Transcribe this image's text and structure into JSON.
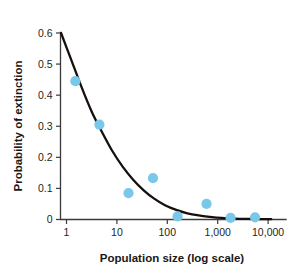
{
  "chart_data": {
    "type": "scatter",
    "title": "",
    "xlabel": "Population size (log scale)",
    "ylabel": "Probability of extinction",
    "x_scale": "log",
    "xlim": [
      0.72,
      14000
    ],
    "ylim": [
      0,
      0.6
    ],
    "grid": false,
    "legend": null,
    "x_ticks": [
      {
        "value": 1,
        "label": "1"
      },
      {
        "value": 10,
        "label": "10"
      },
      {
        "value": 100,
        "label": "100"
      },
      {
        "value": 1000,
        "label": "1,000"
      },
      {
        "value": 10000,
        "label": "10,000"
      }
    ],
    "y_ticks": [
      {
        "value": 0,
        "label": "0"
      },
      {
        "value": 0.1,
        "label": "0.1"
      },
      {
        "value": 0.2,
        "label": "0.2"
      },
      {
        "value": 0.3,
        "label": "0.3"
      },
      {
        "value": 0.4,
        "label": "0.4"
      },
      {
        "value": 0.5,
        "label": "0.5"
      },
      {
        "value": 0.6,
        "label": "0.6"
      }
    ],
    "series": [
      {
        "name": "Observed populations",
        "type": "scatter",
        "marker": "circle",
        "color": "#79c8ea",
        "points": [
          {
            "x": 1.5,
            "y": 0.445
          },
          {
            "x": 4.5,
            "y": 0.305
          },
          {
            "x": 17,
            "y": 0.085
          },
          {
            "x": 52,
            "y": 0.133
          },
          {
            "x": 160,
            "y": 0.01
          },
          {
            "x": 600,
            "y": 0.05
          },
          {
            "x": 1800,
            "y": 0.005
          },
          {
            "x": 5500,
            "y": 0.007
          }
        ]
      },
      {
        "name": "Fitted decay curve",
        "type": "line",
        "color": "#15100d",
        "points": [
          {
            "x": 0.78,
            "y": 0.6
          },
          {
            "x": 1.2,
            "y": 0.52
          },
          {
            "x": 2.0,
            "y": 0.425
          },
          {
            "x": 3.2,
            "y": 0.345
          },
          {
            "x": 5.0,
            "y": 0.283
          },
          {
            "x": 8.0,
            "y": 0.222
          },
          {
            "x": 13,
            "y": 0.17
          },
          {
            "x": 21,
            "y": 0.128
          },
          {
            "x": 34,
            "y": 0.094
          },
          {
            "x": 55,
            "y": 0.067
          },
          {
            "x": 90,
            "y": 0.046
          },
          {
            "x": 150,
            "y": 0.031
          },
          {
            "x": 250,
            "y": 0.02
          },
          {
            "x": 420,
            "y": 0.013
          },
          {
            "x": 700,
            "y": 0.0085
          },
          {
            "x": 1200,
            "y": 0.005
          },
          {
            "x": 2200,
            "y": 0.003
          },
          {
            "x": 4000,
            "y": 0.002
          },
          {
            "x": 7000,
            "y": 0.0015
          },
          {
            "x": 11500,
            "y": 0.001
          }
        ]
      }
    ],
    "colors": {
      "marker": "#79c8ea",
      "curve": "#15100d",
      "axis": "#3a3a3a",
      "text": "#231f1d",
      "background": "#ffffff"
    }
  }
}
